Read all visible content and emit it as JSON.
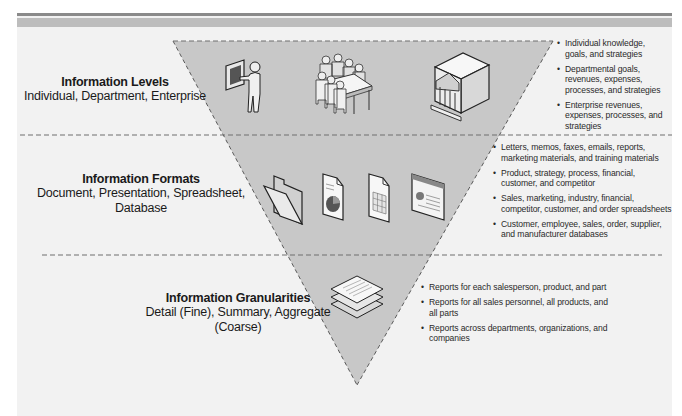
{
  "diagram": {
    "type": "inverted-pyramid",
    "colors": {
      "pyramid_fill": "#c8c8c8",
      "background": "#f2f2f2",
      "dashed_line": "#6e6e6e",
      "top_bar_dark": "#8a8a8a",
      "top_bar_light": "#bdbdbd",
      "text": "#1a1a1a"
    },
    "levels": [
      {
        "title": "Information Levels",
        "subtitle": "Individual, Department, Enterprise",
        "icons": [
          "presenter-icon",
          "meeting-table-icon",
          "enterprise-building-icon"
        ],
        "bullets": [
          "Individual knowledge, goals, and strategies",
          "Departmental goals, revenues, expenses, processes, and strategies",
          "Enterprise revenues, expenses, processes, and strategies"
        ]
      },
      {
        "title": "Information Formats",
        "subtitle": "Document, Presentation, Spreadsheet, Database",
        "icons": [
          "folder-icon",
          "document-chart-icon",
          "spreadsheet-icon",
          "presentation-slide-icon"
        ],
        "bullets": [
          "Letters, memos, faxes, emails, reports, marketing materials, and training materials",
          "Product, strategy, process, financial, customer, and competitor",
          "Sales, marketing, industry, financial, competitor, customer, and order spreadsheets",
          "Customer, employee, sales, order, supplier, and manufacturer databases"
        ]
      },
      {
        "title": "Information Granularities",
        "subtitle": "Detail (Fine), Summary, Aggregate (Coarse)",
        "icons": [
          "stacked-reports-icon"
        ],
        "bullets": [
          "Reports for each salesperson, product, and part",
          "Reports for all sales personnel, all products, and all parts",
          "Reports across departments, organizations, and companies"
        ]
      }
    ]
  }
}
